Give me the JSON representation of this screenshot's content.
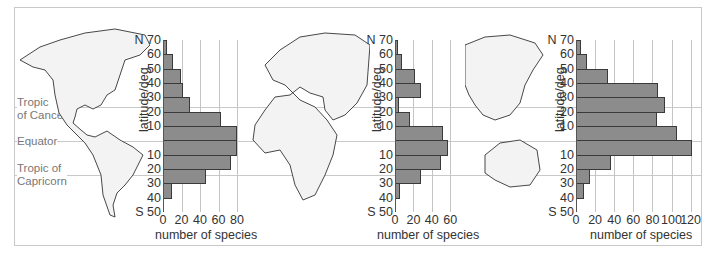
{
  "figure": {
    "reference_lines": [
      {
        "name": "Tropic of Cancer",
        "label_lines": [
          "Tropic",
          "of Cancer"
        ]
      },
      {
        "name": "Equator",
        "label_lines": [
          "Equator"
        ]
      },
      {
        "name": "Tropic of Capricorn",
        "label_lines": [
          "Tropic of",
          "Capricorn"
        ]
      }
    ],
    "maps": [
      "Americas",
      "Europe and Africa",
      "Asia and Australasia"
    ]
  },
  "chart_data": [
    {
      "type": "bar",
      "orientation": "horizontal",
      "region": "Americas",
      "title": "",
      "xlabel": "number of species",
      "ylabel": "latitude/deg",
      "y_tick_labels": [
        "N 70",
        "60",
        "50",
        "40",
        "30",
        "20",
        "10",
        "",
        "10",
        "20",
        "30",
        "40",
        "S 50"
      ],
      "x_tick_labels": [
        "0",
        "20",
        "40",
        "60",
        "80"
      ],
      "xlim": [
        0,
        80
      ],
      "grid": "vertical",
      "categories": [
        "60-70N",
        "50-60N",
        "40-50N",
        "30-40N",
        "20-30N",
        "10-20N",
        "0-10N",
        "0-10S",
        "10-20S",
        "20-30S",
        "30-40S",
        "40-50S"
      ],
      "values": [
        4,
        11,
        19,
        22,
        29,
        63,
        80,
        80,
        73,
        47,
        10,
        0
      ]
    },
    {
      "type": "bar",
      "orientation": "horizontal",
      "region": "Europe and Africa",
      "title": "",
      "xlabel": "number of species",
      "ylabel": "latitude/deg",
      "y_tick_labels": [
        "N 70",
        "60",
        "50",
        "40",
        "30",
        "20",
        "10",
        "",
        "10",
        "20",
        "30",
        "40",
        "S 50"
      ],
      "x_tick_labels": [
        "0",
        "20",
        "40",
        "60"
      ],
      "xlim": [
        0,
        60
      ],
      "grid": "vertical",
      "categories": [
        "60-70N",
        "50-60N",
        "40-50N",
        "30-40N",
        "20-30N",
        "10-20N",
        "0-10N",
        "0-10S",
        "10-20S",
        "20-30S",
        "30-40S",
        "40-50S"
      ],
      "values": [
        3,
        8,
        22,
        28,
        4,
        16,
        52,
        58,
        50,
        28,
        5,
        0
      ]
    },
    {
      "type": "bar",
      "orientation": "horizontal",
      "region": "Asia and Australasia",
      "title": "",
      "xlabel": "number of species",
      "ylabel": "latitude/deg",
      "y_tick_labels": [
        "N 70",
        "60",
        "50",
        "40",
        "30",
        "20",
        "10",
        "",
        "10",
        "20",
        "30",
        "40",
        "S 50"
      ],
      "x_tick_labels": [
        "0",
        "20",
        "40",
        "60",
        "80",
        "100",
        "120"
      ],
      "xlim": [
        0,
        120
      ],
      "grid": "vertical",
      "categories": [
        "60-70N",
        "50-60N",
        "40-50N",
        "30-40N",
        "20-30N",
        "10-20N",
        "0-10N",
        "0-10S",
        "10-20S",
        "20-30S",
        "30-40S",
        "40-50S"
      ],
      "values": [
        5,
        11,
        34,
        86,
        93,
        85,
        106,
        121,
        37,
        15,
        8,
        0
      ]
    }
  ]
}
